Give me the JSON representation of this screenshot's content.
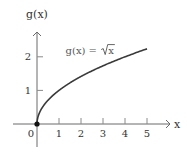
{
  "chart_data": {
    "type": "line",
    "title": "",
    "xlabel": "x",
    "ylabel": "g(x)",
    "xlim": [
      -1.1,
      6.0
    ],
    "ylim": [
      -0.7,
      2.7
    ],
    "x_ticks": [
      1,
      2,
      3,
      4,
      5
    ],
    "x_tick_labels": [
      "1",
      "2",
      "3",
      "4",
      "5"
    ],
    "origin_label": "0",
    "y_ticks": [
      1,
      2
    ],
    "y_tick_labels": [
      "1",
      "2"
    ],
    "grid": false,
    "series": [
      {
        "name": "g(x) = √x",
        "function": "sqrt(x)",
        "domain": [
          0,
          5
        ],
        "start_point": [
          0,
          0
        ],
        "start_point_marker": "filled-dot",
        "color": "#3a3a3a"
      }
    ],
    "annotations": [
      {
        "text_prefix": "g(x) = ",
        "text_radicand": "x",
        "at": [
          1.3,
          2.2
        ]
      }
    ]
  }
}
